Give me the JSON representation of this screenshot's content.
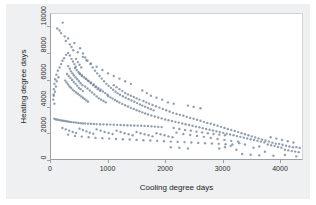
{
  "chart_data": {
    "type": "scatter",
    "title": "",
    "xlabel": "Cooling degree days",
    "ylabel": "Heating degree days",
    "xlim": [
      0,
      4400
    ],
    "ylim": [
      0,
      11000
    ],
    "xticks": [
      0,
      1000,
      2000,
      3000,
      4000
    ],
    "ytick_labels": [
      "0",
      "2000",
      "4000",
      "6000",
      "8000",
      "10000"
    ],
    "xtick_labels": [
      "0",
      "1000",
      "2000",
      "3000",
      "4000"
    ],
    "yticks": [
      0,
      2000,
      4000,
      6000,
      8000,
      10000
    ],
    "grid": false,
    "legend": "none",
    "marker_color": "#6b7f96",
    "marker_size": 1.2,
    "points": [
      [
        110,
        9900
      ],
      [
        150,
        9750
      ],
      [
        175,
        9550
      ],
      [
        205,
        10350
      ],
      [
        240,
        9300
      ],
      [
        260,
        8950
      ],
      [
        300,
        9150
      ],
      [
        330,
        8700
      ],
      [
        360,
        8500
      ],
      [
        390,
        8250
      ],
      [
        410,
        8800
      ],
      [
        300,
        8050
      ],
      [
        265,
        7900
      ],
      [
        230,
        7650
      ],
      [
        200,
        7450
      ],
      [
        175,
        7200
      ],
      [
        150,
        6950
      ],
      [
        120,
        6700
      ],
      [
        95,
        6400
      ],
      [
        75,
        6050
      ],
      [
        60,
        5700
      ],
      [
        50,
        5300
      ],
      [
        45,
        4900
      ],
      [
        40,
        4500
      ],
      [
        60,
        4200
      ],
      [
        330,
        7850
      ],
      [
        360,
        7600
      ],
      [
        385,
        7400
      ],
      [
        410,
        7200
      ],
      [
        435,
        7000
      ],
      [
        300,
        7050
      ],
      [
        330,
        6850
      ],
      [
        350,
        6650
      ],
      [
        375,
        6500
      ],
      [
        400,
        6350
      ],
      [
        430,
        6200
      ],
      [
        460,
        6050
      ],
      [
        490,
        5900
      ],
      [
        520,
        5750
      ],
      [
        550,
        5600
      ],
      [
        280,
        6450
      ],
      [
        310,
        6300
      ],
      [
        340,
        6150
      ],
      [
        370,
        6000
      ],
      [
        400,
        5850
      ],
      [
        430,
        5700
      ],
      [
        460,
        5550
      ],
      [
        490,
        5400
      ],
      [
        520,
        5300
      ],
      [
        560,
        5150
      ],
      [
        250,
        5950
      ],
      [
        275,
        5800
      ],
      [
        300,
        5650
      ],
      [
        325,
        5500
      ],
      [
        350,
        5400
      ],
      [
        380,
        5250
      ],
      [
        410,
        5150
      ],
      [
        440,
        5050
      ],
      [
        470,
        4950
      ],
      [
        500,
        4850
      ],
      [
        530,
        4750
      ],
      [
        560,
        4650
      ],
      [
        590,
        4550
      ],
      [
        620,
        4450
      ],
      [
        650,
        4350
      ],
      [
        600,
        5500
      ],
      [
        640,
        5350
      ],
      [
        680,
        5200
      ],
      [
        720,
        5050
      ],
      [
        760,
        4900
      ],
      [
        800,
        4750
      ],
      [
        840,
        4600
      ],
      [
        880,
        4500
      ],
      [
        920,
        4400
      ],
      [
        960,
        4300
      ],
      [
        610,
        6100
      ],
      [
        650,
        5950
      ],
      [
        700,
        5800
      ],
      [
        750,
        5650
      ],
      [
        790,
        5500
      ],
      [
        830,
        5380
      ],
      [
        870,
        5250
      ],
      [
        910,
        5120
      ],
      [
        950,
        5000
      ],
      [
        990,
        4880
      ],
      [
        500,
        6500
      ],
      [
        540,
        6350
      ],
      [
        580,
        6200
      ],
      [
        620,
        6050
      ],
      [
        660,
        5900
      ],
      [
        700,
        5750
      ],
      [
        740,
        5600
      ],
      [
        780,
        5450
      ],
      [
        820,
        5300
      ],
      [
        860,
        5180
      ],
      [
        420,
        6900
      ],
      [
        450,
        6750
      ],
      [
        480,
        6600
      ],
      [
        510,
        6450
      ],
      [
        545,
        6300
      ],
      [
        440,
        7600
      ],
      [
        470,
        7350
      ],
      [
        500,
        7150
      ],
      [
        530,
        6950
      ],
      [
        470,
        8100
      ],
      [
        510,
        8400
      ],
      [
        560,
        8000
      ],
      [
        600,
        7700
      ],
      [
        640,
        7450
      ],
      [
        690,
        7200
      ],
      [
        730,
        6950
      ],
      [
        770,
        6700
      ],
      [
        810,
        6500
      ],
      [
        850,
        6300
      ],
      [
        890,
        6100
      ],
      [
        930,
        5900
      ],
      [
        970,
        5700
      ],
      [
        1010,
        5550
      ],
      [
        1050,
        5400
      ],
      [
        1090,
        5250
      ],
      [
        1000,
        4780
      ],
      [
        1040,
        4680
      ],
      [
        1080,
        4580
      ],
      [
        1120,
        4480
      ],
      [
        1160,
        4380
      ],
      [
        1200,
        4280
      ],
      [
        1250,
        4180
      ],
      [
        1300,
        4080
      ],
      [
        1350,
        3980
      ],
      [
        1400,
        3880
      ],
      [
        1130,
        5100
      ],
      [
        1170,
        4980
      ],
      [
        1210,
        4870
      ],
      [
        1260,
        4760
      ],
      [
        1310,
        4650
      ],
      [
        1360,
        4540
      ],
      [
        1410,
        4440
      ],
      [
        1460,
        4340
      ],
      [
        1510,
        4240
      ],
      [
        1560,
        4140
      ],
      [
        1100,
        5600
      ],
      [
        1150,
        5450
      ],
      [
        1200,
        5300
      ],
      [
        1250,
        5150
      ],
      [
        1300,
        5000
      ],
      [
        1350,
        4900
      ],
      [
        1400,
        4800
      ],
      [
        1450,
        4700
      ],
      [
        1500,
        4600
      ],
      [
        1550,
        4500
      ],
      [
        1600,
        4050
      ],
      [
        1650,
        3960
      ],
      [
        1700,
        3870
      ],
      [
        1750,
        3780
      ],
      [
        1800,
        3690
      ],
      [
        1620,
        4400
      ],
      [
        1670,
        4300
      ],
      [
        1720,
        4200
      ],
      [
        1780,
        4100
      ],
      [
        1840,
        4000
      ],
      [
        1450,
        3800
      ],
      [
        1500,
        3700
      ],
      [
        1550,
        3620
      ],
      [
        1600,
        3540
      ],
      [
        1650,
        3460
      ],
      [
        1700,
        3380
      ],
      [
        1760,
        3300
      ],
      [
        1820,
        3220
      ],
      [
        1880,
        3150
      ],
      [
        1940,
        3080
      ],
      [
        1900,
        3900
      ],
      [
        1960,
        3800
      ],
      [
        2020,
        3700
      ],
      [
        2080,
        3600
      ],
      [
        2140,
        3500
      ],
      [
        2000,
        3000
      ],
      [
        2060,
        2940
      ],
      [
        2120,
        2880
      ],
      [
        2180,
        2820
      ],
      [
        2240,
        2760
      ],
      [
        2300,
        2700
      ],
      [
        2360,
        2640
      ],
      [
        2420,
        2580
      ],
      [
        2480,
        2520
      ],
      [
        2540,
        2460
      ],
      [
        2200,
        3420
      ],
      [
        2260,
        3350
      ],
      [
        2320,
        3280
      ],
      [
        2380,
        3200
      ],
      [
        2440,
        3120
      ],
      [
        2500,
        3050
      ],
      [
        2560,
        2980
      ],
      [
        2620,
        2900
      ],
      [
        2680,
        2820
      ],
      [
        2740,
        2740
      ],
      [
        2600,
        2400
      ],
      [
        2660,
        2340
      ],
      [
        2720,
        2280
      ],
      [
        2780,
        2220
      ],
      [
        2840,
        2160
      ],
      [
        2800,
        2680
      ],
      [
        2860,
        2600
      ],
      [
        2920,
        2520
      ],
      [
        2980,
        2440
      ],
      [
        3040,
        2360
      ],
      [
        2900,
        2100
      ],
      [
        2960,
        2040
      ],
      [
        3020,
        1980
      ],
      [
        3080,
        1920
      ],
      [
        3140,
        1860
      ],
      [
        3100,
        2280
      ],
      [
        3160,
        2200
      ],
      [
        3220,
        2120
      ],
      [
        3280,
        2040
      ],
      [
        3340,
        1960
      ],
      [
        3200,
        1800
      ],
      [
        3260,
        1740
      ],
      [
        3320,
        1680
      ],
      [
        3380,
        1620
      ],
      [
        3440,
        1560
      ],
      [
        3400,
        1880
      ],
      [
        3460,
        1800
      ],
      [
        3520,
        1720
      ],
      [
        3580,
        1640
      ],
      [
        3640,
        1560
      ],
      [
        3500,
        1500
      ],
      [
        3560,
        1440
      ],
      [
        3620,
        1380
      ],
      [
        3680,
        1320
      ],
      [
        3740,
        1260
      ],
      [
        3700,
        1480
      ],
      [
        3760,
        1400
      ],
      [
        3820,
        1320
      ],
      [
        3880,
        1240
      ],
      [
        3940,
        1160
      ],
      [
        3800,
        1100
      ],
      [
        3860,
        1040
      ],
      [
        3920,
        980
      ],
      [
        3980,
        920
      ],
      [
        4040,
        860
      ],
      [
        4000,
        1150
      ],
      [
        4060,
        1080
      ],
      [
        4120,
        1010
      ],
      [
        4180,
        950
      ],
      [
        4240,
        890
      ],
      [
        4100,
        700
      ],
      [
        4160,
        650
      ],
      [
        4220,
        600
      ],
      [
        4280,
        560
      ],
      [
        4340,
        520
      ],
      [
        4300,
        900
      ],
      [
        4360,
        840
      ],
      [
        4250,
        1250
      ],
      [
        4150,
        1350
      ],
      [
        4050,
        1450
      ],
      [
        3950,
        1550
      ],
      [
        3850,
        1650
      ],
      [
        3300,
        1200
      ],
      [
        3400,
        1100
      ],
      [
        3150,
        1000
      ],
      [
        3050,
        900
      ],
      [
        2950,
        800
      ],
      [
        3250,
        700
      ],
      [
        3550,
        850
      ],
      [
        3650,
        950
      ],
      [
        60,
        3050
      ],
      [
        90,
        3000
      ],
      [
        120,
        2980
      ],
      [
        150,
        2950
      ],
      [
        180,
        2920
      ],
      [
        210,
        2900
      ],
      [
        240,
        2880
      ],
      [
        270,
        2860
      ],
      [
        300,
        2840
      ],
      [
        330,
        2820
      ],
      [
        360,
        2800
      ],
      [
        400,
        2780
      ],
      [
        440,
        2760
      ],
      [
        480,
        2740
      ],
      [
        520,
        2720
      ],
      [
        560,
        2700
      ],
      [
        600,
        2690
      ],
      [
        650,
        2680
      ],
      [
        700,
        2670
      ],
      [
        750,
        2660
      ],
      [
        800,
        2650
      ],
      [
        860,
        2640
      ],
      [
        920,
        2630
      ],
      [
        980,
        2620
      ],
      [
        1040,
        2610
      ],
      [
        1100,
        2600
      ],
      [
        1160,
        2590
      ],
      [
        1220,
        2580
      ],
      [
        1280,
        2570
      ],
      [
        1340,
        2560
      ],
      [
        1400,
        2550
      ],
      [
        1460,
        2540
      ],
      [
        1520,
        2530
      ],
      [
        1580,
        2520
      ],
      [
        1640,
        2510
      ],
      [
        1700,
        2500
      ],
      [
        1760,
        2480
      ],
      [
        1820,
        2460
      ],
      [
        1880,
        2440
      ],
      [
        1940,
        2420
      ],
      [
        200,
        2350
      ],
      [
        260,
        2250
      ],
      [
        320,
        2150
      ],
      [
        380,
        2050
      ],
      [
        440,
        1980
      ],
      [
        500,
        2300
      ],
      [
        560,
        2200
      ],
      [
        620,
        2100
      ],
      [
        680,
        2000
      ],
      [
        740,
        1920
      ],
      [
        800,
        2250
      ],
      [
        870,
        2150
      ],
      [
        940,
        2050
      ],
      [
        1010,
        1980
      ],
      [
        1080,
        1900
      ],
      [
        1150,
        2150
      ],
      [
        1220,
        2050
      ],
      [
        1290,
        1950
      ],
      [
        1360,
        1880
      ],
      [
        1430,
        1800
      ],
      [
        1500,
        2050
      ],
      [
        1570,
        1950
      ],
      [
        1640,
        1880
      ],
      [
        1710,
        1800
      ],
      [
        1780,
        1720
      ],
      [
        1850,
        1950
      ],
      [
        1920,
        1880
      ],
      [
        1990,
        1800
      ],
      [
        2060,
        1720
      ],
      [
        2130,
        1650
      ],
      [
        300,
        1850
      ],
      [
        420,
        1750
      ],
      [
        540,
        1700
      ],
      [
        660,
        1650
      ],
      [
        780,
        1600
      ],
      [
        900,
        1580
      ],
      [
        1020,
        1550
      ],
      [
        1140,
        1520
      ],
      [
        1260,
        1500
      ],
      [
        1380,
        1480
      ],
      [
        1500,
        1450
      ],
      [
        1620,
        1420
      ],
      [
        1740,
        1400
      ],
      [
        1860,
        1380
      ],
      [
        1980,
        1350
      ],
      [
        2100,
        1320
      ],
      [
        2220,
        1300
      ],
      [
        2340,
        1280
      ],
      [
        2460,
        1250
      ],
      [
        2580,
        1220
      ],
      [
        2700,
        1200
      ],
      [
        2820,
        1180
      ],
      [
        2940,
        1150
      ],
      [
        3060,
        1120
      ],
      [
        3180,
        1100
      ],
      [
        2150,
        2350
      ],
      [
        2250,
        2280
      ],
      [
        2350,
        2200
      ],
      [
        2450,
        2150
      ],
      [
        2550,
        2080
      ],
      [
        2650,
        2020
      ],
      [
        2750,
        1960
      ],
      [
        2850,
        1900
      ],
      [
        2950,
        1850
      ],
      [
        3050,
        1800
      ],
      [
        50,
        4800
      ],
      [
        70,
        5100
      ],
      [
        85,
        5500
      ],
      [
        100,
        5900
      ],
      [
        130,
        6200
      ],
      [
        2400,
        4050
      ],
      [
        2500,
        3950
      ],
      [
        2620,
        3850
      ],
      [
        2150,
        4200
      ],
      [
        2050,
        4300
      ],
      [
        1950,
        4500
      ],
      [
        1850,
        4650
      ],
      [
        1750,
        4800
      ],
      [
        1680,
        5000
      ],
      [
        1600,
        5200
      ],
      [
        1400,
        5700
      ],
      [
        1300,
        5900
      ],
      [
        1200,
        6100
      ],
      [
        1100,
        6300
      ],
      [
        1000,
        6500
      ],
      [
        900,
        6750
      ],
      [
        800,
        7000
      ],
      [
        700,
        7250
      ],
      [
        620,
        7500
      ],
      [
        560,
        7750
      ],
      [
        2200,
        2000
      ],
      [
        2320,
        1900
      ],
      [
        2440,
        1820
      ],
      [
        2560,
        1750
      ],
      [
        2680,
        1680
      ],
      [
        2800,
        1600
      ],
      [
        2920,
        1520
      ],
      [
        3040,
        1450
      ],
      [
        3160,
        1380
      ],
      [
        3280,
        1320
      ],
      [
        2100,
        900
      ],
      [
        2250,
        850
      ],
      [
        2400,
        800
      ],
      [
        3350,
        380
      ],
      [
        3500,
        320
      ],
      [
        3650,
        280
      ],
      [
        3900,
        250
      ],
      [
        4100,
        300
      ],
      [
        4300,
        200
      ],
      [
        3750,
        550
      ]
    ]
  },
  "axes": {
    "y_title": "Heating degree days",
    "x_title": "Cooling degree days"
  }
}
